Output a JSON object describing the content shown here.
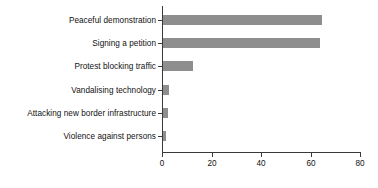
{
  "chart_data": {
    "type": "bar",
    "orientation": "horizontal",
    "title": "",
    "subtitle": "",
    "xlabel": "",
    "ylabel": "",
    "categories": [
      "Peaceful demonstration",
      "Signing a petition",
      "Protest blocking traffic",
      "Vandalising technology",
      "Attacking new border infrastructure",
      "Violence against persons"
    ],
    "values": [
      64.5,
      63.5,
      12.5,
      2.8,
      2.3,
      1.3
    ],
    "xlim": [
      0,
      80
    ],
    "xticks": [
      0,
      20,
      40,
      60,
      80
    ],
    "xtick_labels": [
      "0",
      "20",
      "40",
      "60",
      "80"
    ],
    "grid": false,
    "legend": null,
    "bar_color": "#8e8e8e",
    "axis_color": "#3a3a3a",
    "background_color": "#ffffff"
  }
}
